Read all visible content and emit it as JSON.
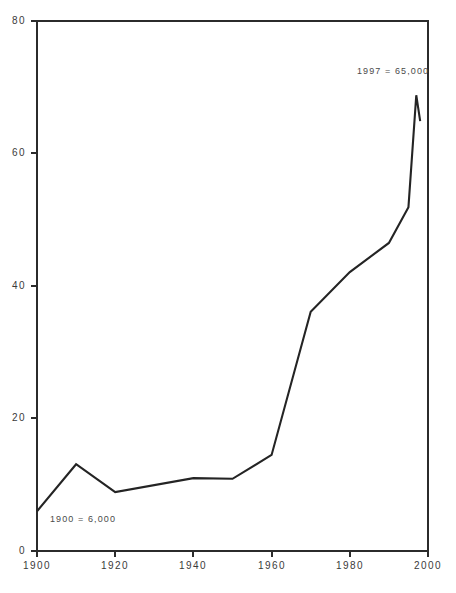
{
  "chart_data": {
    "type": "line",
    "title": "",
    "xlabel": "",
    "ylabel": "",
    "xlim": [
      1900,
      2000
    ],
    "ylim": [
      0,
      80
    ],
    "grid": false,
    "legend": null,
    "xticks": [
      "1900",
      "1920",
      "1940",
      "1960",
      "1980",
      "2000"
    ],
    "xtick_values": [
      1900,
      1920,
      1940,
      1960,
      1980,
      2000
    ],
    "yticks": [
      "0",
      "20",
      "40",
      "60",
      "80"
    ],
    "ytick_values": [
      0,
      20,
      40,
      60,
      80
    ],
    "x": [
      1900,
      1910,
      1920,
      1940,
      1950,
      1960,
      1970,
      1980,
      1990,
      1995,
      1997,
      1998
    ],
    "values": [
      6,
      13.1,
      8.9,
      11.0,
      10.9,
      14.5,
      36.1,
      42.1,
      46.5,
      51.9,
      68.8,
      64.9
    ],
    "series": [
      {
        "name": "series-1",
        "values": [
          6,
          13.1,
          8.9,
          11.0,
          10.9,
          14.5,
          36.1,
          42.1,
          46.5,
          51.9,
          68.8,
          64.9
        ]
      }
    ],
    "annotations": [
      {
        "id": "start-label",
        "text": "1900 = 6,000",
        "x": 1900,
        "y": 6
      },
      {
        "id": "peak-label",
        "text": "1997 = 65,000",
        "x": 1997,
        "y": 65
      }
    ]
  },
  "axes": {
    "x_labels": [
      {
        "label": "1900"
      },
      {
        "label": "1920"
      },
      {
        "label": "1940"
      },
      {
        "label": "1960"
      },
      {
        "label": "1980"
      },
      {
        "label": "2000"
      }
    ],
    "y_labels": [
      {
        "label": "80"
      },
      {
        "label": "60"
      },
      {
        "label": "40"
      },
      {
        "label": "20"
      },
      {
        "label": "0"
      }
    ]
  },
  "annotations": {
    "start": "1900 = 6,000",
    "peak": "1997 = 65,000"
  },
  "colors": {
    "line": "#242424",
    "axis": "#2b2b2b",
    "text": "#3a3a3a",
    "background": "#ffffff"
  }
}
